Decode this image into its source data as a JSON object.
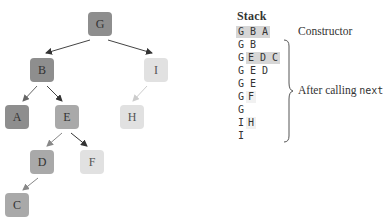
{
  "tree": {
    "nodes": [
      {
        "id": "G",
        "label": "G",
        "shade": "dark",
        "x": 88,
        "y": 12
      },
      {
        "id": "B",
        "label": "B",
        "shade": "dark",
        "x": 30,
        "y": 58
      },
      {
        "id": "I",
        "label": "I",
        "shade": "light",
        "x": 144,
        "y": 58
      },
      {
        "id": "A",
        "label": "A",
        "shade": "dark",
        "x": 5,
        "y": 105
      },
      {
        "id": "E",
        "label": "E",
        "shade": "mid",
        "x": 55,
        "y": 105
      },
      {
        "id": "H",
        "label": "H",
        "shade": "light",
        "x": 120,
        "y": 105
      },
      {
        "id": "D",
        "label": "D",
        "shade": "mid",
        "x": 30,
        "y": 150
      },
      {
        "id": "F",
        "label": "F",
        "shade": "light",
        "x": 80,
        "y": 150
      },
      {
        "id": "C",
        "label": "C",
        "shade": "mid",
        "x": 5,
        "y": 193
      }
    ],
    "edges": [
      {
        "from": "G",
        "to": "B",
        "color": "#444444"
      },
      {
        "from": "G",
        "to": "I",
        "color": "#444444"
      },
      {
        "from": "B",
        "to": "A",
        "color": "#666666"
      },
      {
        "from": "B",
        "to": "E",
        "color": "#444444"
      },
      {
        "from": "I",
        "to": "H",
        "color": "#cccccc"
      },
      {
        "from": "E",
        "to": "D",
        "color": "#888888"
      },
      {
        "from": "E",
        "to": "F",
        "color": "#333333"
      },
      {
        "from": "D",
        "to": "C",
        "color": "#888888"
      }
    ]
  },
  "stack": {
    "title": "Stack",
    "rows": [
      {
        "plain": "",
        "highlight": "G B A",
        "faint": ""
      },
      {
        "plain": "G B",
        "highlight": "",
        "faint": ""
      },
      {
        "plain": "G",
        "highlight": "E D C",
        "faint": ""
      },
      {
        "plain": "G E D",
        "highlight": "",
        "faint": ""
      },
      {
        "plain": "G E",
        "highlight": "",
        "faint": ""
      },
      {
        "plain": "G",
        "highlight": "",
        "faint": "F"
      },
      {
        "plain": "G",
        "highlight": "",
        "faint": ""
      },
      {
        "plain": "I",
        "highlight": "",
        "faint": "H"
      },
      {
        "plain": "I",
        "highlight": "",
        "faint": ""
      }
    ]
  },
  "annotations": {
    "constructor": "Constructor",
    "after_calling_prefix": "After calling ",
    "after_calling_code": "next"
  }
}
